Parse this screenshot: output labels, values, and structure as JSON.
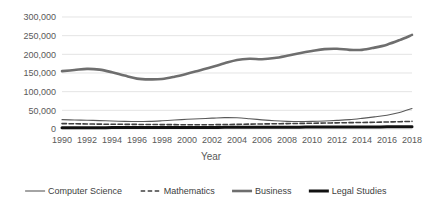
{
  "chart_data": {
    "type": "line",
    "title": "",
    "xlabel": "Year",
    "ylabel": "",
    "grid": "horizontal",
    "legend_position": "bottom",
    "xlim": [
      1990,
      2018
    ],
    "ylim": [
      0,
      300000
    ],
    "x": [
      1990,
      1991,
      1992,
      1993,
      1994,
      1995,
      1996,
      1997,
      1998,
      1999,
      2000,
      2001,
      2002,
      2003,
      2004,
      2005,
      2006,
      2007,
      2008,
      2009,
      2010,
      2011,
      2012,
      2013,
      2014,
      2015,
      2016,
      2017,
      2018
    ],
    "xticks": [
      "1990",
      "1992",
      "1994",
      "1996",
      "1998",
      "2000",
      "2002",
      "2004",
      "2006",
      "2008",
      "2010",
      "2012",
      "2014",
      "2016",
      "2018"
    ],
    "yticks": [
      "0",
      "50,000",
      "100,000",
      "150,000",
      "200,000",
      "250,000",
      "300,000"
    ],
    "ytick_values": [
      0,
      50000,
      100000,
      150000,
      200000,
      250000,
      300000
    ],
    "series": [
      {
        "name": "Computer Science",
        "style": "solid-thin",
        "color": "#595959",
        "width": 1.1,
        "values": [
          25000,
          24000,
          23500,
          22500,
          21500,
          20500,
          20000,
          20500,
          22000,
          24000,
          26000,
          27500,
          29000,
          30500,
          30000,
          27500,
          24500,
          22000,
          20500,
          20000,
          20500,
          21500,
          23000,
          25000,
          28500,
          32500,
          37000,
          44000,
          55000
        ]
      },
      {
        "name": "Mathematics",
        "style": "dashed",
        "color": "#404040",
        "width": 1.6,
        "values": [
          14500,
          14000,
          13500,
          13000,
          12800,
          12500,
          12300,
          12000,
          11800,
          11600,
          11500,
          11400,
          11500,
          12000,
          12500,
          13000,
          13500,
          14000,
          14500,
          15000,
          15500,
          16000,
          16500,
          17000,
          17500,
          18000,
          18800,
          19500,
          20500
        ]
      },
      {
        "name": "Business",
        "style": "solid-medium",
        "color": "#6e6e6e",
        "width": 2.6,
        "values": [
          155000,
          158000,
          161000,
          159000,
          152000,
          143000,
          135000,
          133000,
          134000,
          140000,
          148000,
          157000,
          166000,
          176000,
          185000,
          188000,
          187000,
          190000,
          196000,
          203000,
          209000,
          214000,
          215000,
          212000,
          212000,
          218000,
          226000,
          238000,
          252000
        ]
      },
      {
        "name": "Legal Studies",
        "style": "solid-thick",
        "color": "#111111",
        "width": 3.0,
        "values": [
          3500,
          3500,
          3600,
          3600,
          3700,
          3700,
          3800,
          3800,
          3900,
          4000,
          4100,
          4200,
          4300,
          4400,
          4500,
          4600,
          4700,
          4800,
          4900,
          5000,
          5100,
          5200,
          5300,
          5400,
          5500,
          5600,
          5700,
          5800,
          6000
        ]
      }
    ]
  }
}
